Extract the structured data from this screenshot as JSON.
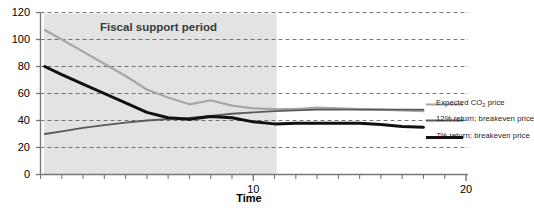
{
  "chart_data": {
    "type": "line",
    "title": "",
    "xlabel": "Time",
    "ylabel": "",
    "xlim": [
      0,
      20
    ],
    "ylim": [
      0,
      120
    ],
    "ytick_values": [
      0,
      20,
      40,
      60,
      80,
      100,
      120
    ],
    "ytick_labels": [
      "0",
      "20",
      "40",
      "60",
      "80",
      "100",
      "120"
    ],
    "xtick_values": [
      10,
      20
    ],
    "xtick_labels": [
      "10",
      "20"
    ],
    "xtick_minor_step": 1,
    "grid": "horizontal-dashed",
    "legend_position": "right-inline",
    "annotations": [
      {
        "text": "Fiscal support period",
        "type": "shaded-band",
        "x_start": 0,
        "x_end": 11.1,
        "band_color": "#e3e3e3"
      }
    ],
    "series": [
      {
        "name": "Expected CO2 price",
        "label": "Expected CO₂ price",
        "color": "#a6a6a6",
        "width": 2.2,
        "x": [
          0.2,
          1,
          2,
          3,
          4,
          5,
          6,
          7,
          8,
          9,
          10,
          11,
          12,
          13,
          14,
          15,
          16,
          17,
          18
        ],
        "y": [
          107,
          100,
          91,
          82,
          73,
          63,
          57,
          52,
          55,
          51,
          49,
          48.5,
          48.5,
          49.5,
          49,
          48.5,
          48,
          47.5,
          47
        ]
      },
      {
        "name": "12% return; breakeven price",
        "label": "12% return; breakeven price",
        "color": "#5a5a5a",
        "width": 1.8,
        "x": [
          0.2,
          1,
          2,
          3,
          4,
          5,
          6,
          7,
          8,
          9,
          10,
          11,
          12,
          13,
          14,
          15,
          16,
          17,
          18
        ],
        "y": [
          30,
          32,
          34.5,
          36.5,
          38.5,
          40,
          41,
          42,
          43.5,
          45,
          46,
          47,
          47.5,
          48,
          48,
          48,
          48,
          48,
          48
        ]
      },
      {
        "name": "7% return; breakeven price",
        "label": "7% return; breakeven price",
        "color": "#111111",
        "width": 3.0,
        "x": [
          0.2,
          1,
          2,
          3,
          4,
          5,
          6,
          7,
          8,
          9,
          10,
          11,
          12,
          13,
          14,
          15,
          16,
          17,
          18
        ],
        "y": [
          80,
          74,
          67,
          60,
          53,
          46,
          42,
          41,
          43,
          42,
          39,
          37.5,
          38,
          38,
          38,
          38,
          37,
          35.5,
          35
        ]
      }
    ]
  },
  "axis": {
    "x_title": "Time"
  },
  "band": {
    "label": "Fiscal support period"
  },
  "legend": {
    "items": [
      {
        "prefix": "Expected CO",
        "sub": "2",
        "suffix": " price"
      },
      {
        "text": "12% return; breakeven price"
      },
      {
        "text": "7% return; breakeven price"
      }
    ]
  }
}
